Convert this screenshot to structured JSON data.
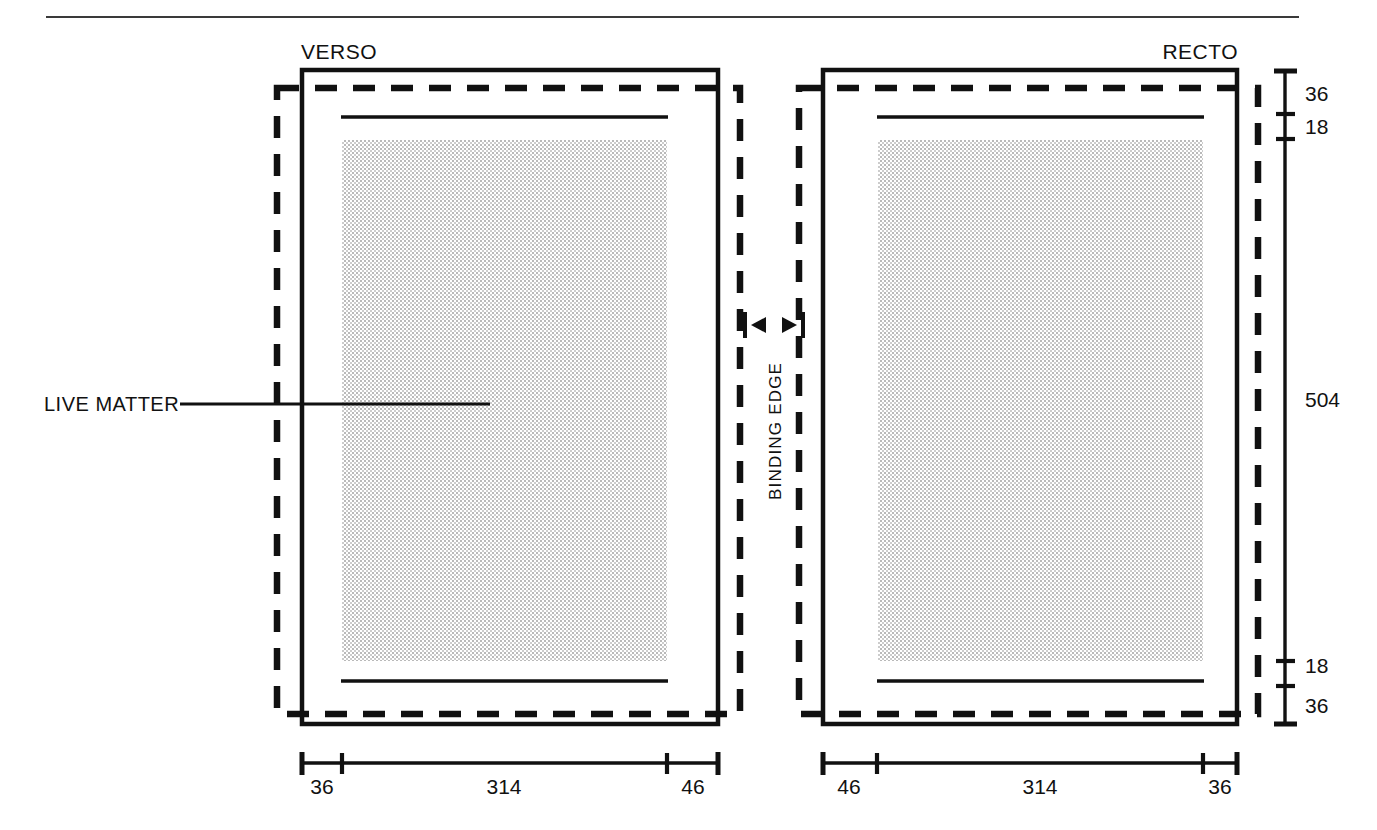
{
  "document": {
    "title": "Page layout specification diagram",
    "top_rule": true
  },
  "pages": {
    "verso": {
      "label": "VERSO"
    },
    "recto": {
      "label": "RECTO"
    }
  },
  "annotations": {
    "live_matter": "LIVE MATTER",
    "binding_edge": "BINDING EDGE"
  },
  "vertical_scale": {
    "segments": [
      {
        "value": "36"
      },
      {
        "value": "18"
      },
      {
        "value": "504"
      },
      {
        "value": "18"
      },
      {
        "value": "36"
      }
    ]
  },
  "horizontal_scales": {
    "verso": {
      "segments": [
        {
          "value": "36"
        },
        {
          "value": "314"
        },
        {
          "value": "46"
        }
      ]
    },
    "recto": {
      "segments": [
        {
          "value": "46"
        },
        {
          "value": "314"
        },
        {
          "value": "36"
        }
      ]
    }
  },
  "colors": {
    "ink": "#111111",
    "stipple": "#d9d9d9",
    "page_fill": "#ffffff",
    "background": "#ffffff"
  },
  "legend": {
    "trim_line": "solid-trim-edge",
    "bleed_line": "dashed-bleed-edge",
    "live_area": "stippled-live-matter-area"
  }
}
